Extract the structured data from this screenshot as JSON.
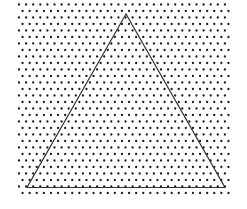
{
  "diagram": {
    "type": "triangular-lattice-with-triangle",
    "background": "#ffffff",
    "lattice": {
      "dot_color": "#1a1a1a",
      "dot_radius": 1.15,
      "x_start": 19,
      "y_start": 4.5,
      "dx": 7.1,
      "dy": 6.5,
      "rows": 30,
      "cols": 30,
      "odd_row_offset": 3.55,
      "x_max": 229
    },
    "triangle": {
      "stroke": "#333333",
      "stroke_width": 1.2,
      "vertices": [
        [
          126,
          14
        ],
        [
          27,
          187.5
        ],
        [
          225,
          187.5
        ]
      ]
    }
  }
}
